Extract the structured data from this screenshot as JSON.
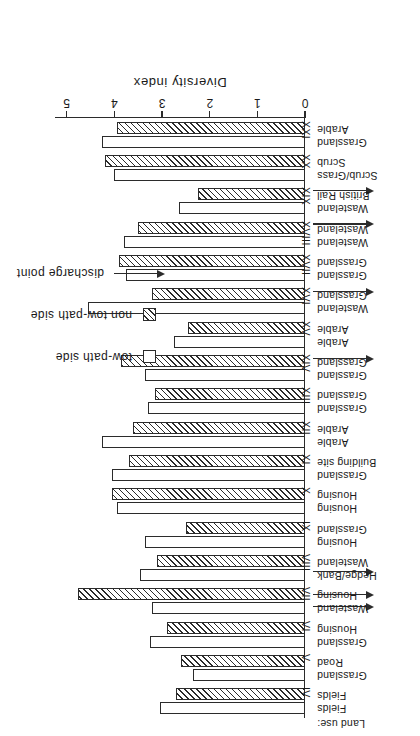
{
  "figure": {
    "axis_title": "Diversity index",
    "landuse_header": "Land use:",
    "tick_labels": [
      "0",
      "1",
      "2",
      "3",
      "4",
      "5"
    ]
  },
  "legend": {
    "items": [
      {
        "key": "open-square",
        "label": "tow-path side"
      },
      {
        "key": "hatched-square",
        "label": "non tow-path side"
      },
      {
        "key": "arrow",
        "label": "discharge point"
      }
    ]
  },
  "chart_data": {
    "type": "bar",
    "title": "",
    "xlabel": "Diversity index",
    "ylabel": "",
    "xlim": [
      0,
      5.2
    ],
    "grid": false,
    "orientation": "horizontal",
    "legend_position": "upper-left",
    "categories": [
      "IV",
      "V",
      "VI",
      "VII",
      "VIII",
      "IX",
      "X",
      "XI",
      "XII",
      "XIII",
      "XIV",
      "XV",
      "XVI",
      "XVII",
      "XVIII",
      "XIX",
      "XX",
      "XXI"
    ],
    "series": [
      {
        "name": "tow-path side",
        "values": [
          3.05,
          2.35,
          3.25,
          3.2,
          3.45,
          3.35,
          3.95,
          4.05,
          4.25,
          3.3,
          3.35,
          2.75,
          4.55,
          3.75,
          3.8,
          2.65,
          4.0,
          4.25
        ]
      },
      {
        "name": "non tow-path side",
        "values": [
          2.7,
          2.6,
          2.9,
          4.75,
          3.1,
          2.5,
          4.05,
          3.7,
          3.6,
          3.15,
          3.85,
          2.45,
          3.2,
          3.9,
          3.5,
          2.25,
          4.2,
          3.95
        ]
      }
    ],
    "land_use": [
      {
        "site": "IV",
        "tow_path": "Fields",
        "non_tow_path": "Fields"
      },
      {
        "site": "V",
        "tow_path": "Grassland",
        "non_tow_path": "Road"
      },
      {
        "site": "VI",
        "tow_path": "Grassland",
        "non_tow_path": "Housing"
      },
      {
        "site": "VII",
        "tow_path": "Wasteland",
        "non_tow_path": "Housing"
      },
      {
        "site": "VIII",
        "tow_path": "Hedge/Bank",
        "non_tow_path": "Wasteland"
      },
      {
        "site": "IX",
        "tow_path": "Housing",
        "non_tow_path": "Grassland"
      },
      {
        "site": "X",
        "tow_path": "Housing",
        "non_tow_path": "Housing"
      },
      {
        "site": "XI",
        "tow_path": "Grassland",
        "non_tow_path": "Building site"
      },
      {
        "site": "XII",
        "tow_path": "Arable",
        "non_tow_path": "Arable"
      },
      {
        "site": "XIII",
        "tow_path": "Grassland",
        "non_tow_path": "Grassland"
      },
      {
        "site": "XIV",
        "tow_path": "Grassland",
        "non_tow_path": "Grassland"
      },
      {
        "site": "XV",
        "tow_path": "Arable",
        "non_tow_path": "Arable"
      },
      {
        "site": "XVI",
        "tow_path": "Wasteland",
        "non_tow_path": "Grassland"
      },
      {
        "site": "XVII",
        "tow_path": "Grassland",
        "non_tow_path": "Grassland"
      },
      {
        "site": "XVIII",
        "tow_path": "Wasteland",
        "non_tow_path": "Wasteland"
      },
      {
        "site": "XIX",
        "tow_path": "Wasteland",
        "non_tow_path": "British Rail"
      },
      {
        "site": "XX",
        "tow_path": "Scrub/Grass",
        "non_tow_path": "Scrub"
      },
      {
        "site": "XXI",
        "tow_path": "Grassland",
        "non_tow_path": "Arable"
      }
    ],
    "discharge_points": [
      "VII",
      "VII",
      "VIII",
      "XIV",
      "XVI",
      "XVIII",
      "XIX"
    ],
    "annotations": [
      "Arrows mark discharge points"
    ]
  }
}
